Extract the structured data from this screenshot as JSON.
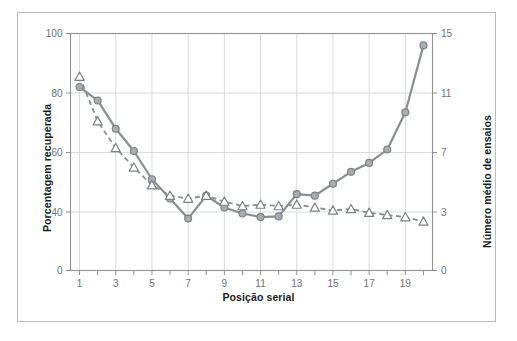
{
  "figure": {
    "background_color": "#ffffff",
    "frame_color": "#b9bcc0"
  },
  "chart_data": {
    "type": "line",
    "title": "",
    "xlabel": "Posição serial",
    "ylabel": "Porcentagem recuperada",
    "ylabel_right": "Número médio de ensaios",
    "x": [
      1,
      2,
      3,
      4,
      5,
      6,
      7,
      8,
      9,
      10,
      11,
      12,
      13,
      14,
      15,
      16,
      17,
      18,
      19,
      20
    ],
    "xticklabels": [
      "1",
      "",
      "3",
      "",
      "5",
      "",
      "7",
      "",
      "9",
      "",
      "11",
      "",
      "13",
      "",
      "15",
      "",
      "17",
      "",
      "19",
      ""
    ],
    "xlim": [
      0.5,
      20.5
    ],
    "yticks_left": [
      0,
      40,
      60,
      80,
      100
    ],
    "yticklabels_left": [
      "0",
      "40",
      "60",
      "80",
      "100"
    ],
    "yticks_right": [
      0,
      3,
      7,
      11,
      15
    ],
    "yticklabels_right": [
      "0",
      "3",
      "7",
      "11",
      "15"
    ],
    "ylim": [
      0,
      100
    ],
    "grid": true,
    "legend": "none",
    "series": [
      {
        "name": "Porcentagem recuperada",
        "axis": "left",
        "marker": "circle-filled",
        "linestyle": "solid",
        "color": "#8a8d91",
        "values": [
          82,
          77.5,
          68,
          60.5,
          51,
          44.5,
          35.5,
          45.5,
          41.5,
          39,
          36.5,
          37,
          46,
          45.5,
          49.5,
          53.5,
          56.5,
          61,
          73.5,
          96
        ]
      },
      {
        "name": "Número médio de ensaios",
        "axis": "right",
        "marker": "triangle-open",
        "linestyle": "dashed",
        "color": "#8a8d91",
        "values_left_scale": [
          85.5,
          70.5,
          61.5,
          55,
          49,
          45.5,
          44.5,
          45.5,
          43.5,
          42,
          42.5,
          42,
          42.5,
          41.5,
          40.5,
          41,
          39.5,
          38,
          36.5,
          33.5
        ],
        "values": [
          11.9,
          9.0,
          7.7,
          7.0,
          6.2,
          5.7,
          5.6,
          5.7,
          5.5,
          5.3,
          5.4,
          5.3,
          5.4,
          5.2,
          5.1,
          5.2,
          5.0,
          4.8,
          4.6,
          4.2
        ]
      }
    ]
  }
}
